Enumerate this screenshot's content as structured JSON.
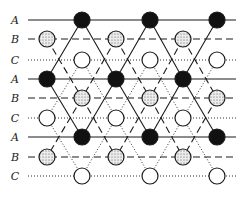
{
  "diagram": {
    "row_labels": [
      "A",
      "B",
      "C",
      "A",
      "B",
      "C",
      "A",
      "B",
      "C"
    ],
    "row_y": [
      20,
      39,
      60,
      79,
      98,
      118,
      137,
      157,
      176
    ],
    "row_styles": [
      "solid",
      "dashed",
      "dotted",
      "solid",
      "dashed",
      "dotted",
      "solid",
      "dashed",
      "dotted"
    ],
    "line_x_start": 28,
    "line_x_end": 236,
    "label_x": 15,
    "circle_radius": 8,
    "rows": [
      {
        "label": "A",
        "fill": "filled",
        "x": [
          82,
          150,
          217
        ]
      },
      {
        "label": "B",
        "fill": "dotted",
        "x": [
          47,
          116,
          183
        ]
      },
      {
        "label": "C",
        "fill": "open",
        "x": [
          82,
          150,
          217
        ]
      },
      {
        "label": "A",
        "fill": "filled",
        "x": [
          47,
          116,
          183
        ]
      },
      {
        "label": "B",
        "fill": "dotted",
        "x": [
          82,
          150,
          217
        ]
      },
      {
        "label": "C",
        "fill": "open",
        "x": [
          47,
          116,
          183
        ]
      },
      {
        "label": "A",
        "fill": "filled",
        "x": [
          82,
          150,
          217
        ]
      },
      {
        "label": "B",
        "fill": "dotted",
        "x": [
          47,
          116,
          183
        ]
      },
      {
        "label": "C",
        "fill": "open",
        "x": [
          82,
          150,
          217
        ]
      }
    ],
    "colors": {
      "ink": "#1a1a1a",
      "filled": "#111111",
      "open": "#ffffff",
      "dotted_bg": "#e6e6e6"
    }
  }
}
